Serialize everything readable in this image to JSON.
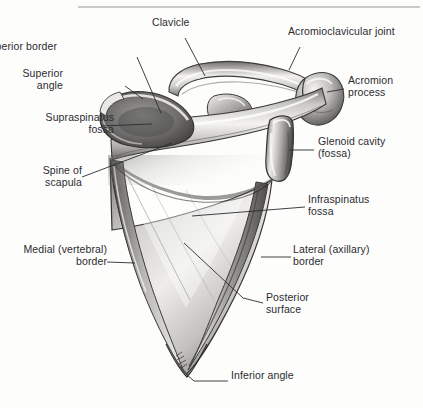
{
  "figure": {
    "type": "anatomical-illustration",
    "style": "grayscale pencil/airbrush medical illustration",
    "background_color": "#fdfdfc",
    "ink_color": "#2b2b2f",
    "bone_light": "#f3f2f0",
    "bone_mid": "#b8b7b4",
    "bone_dark": "#6e6d6b",
    "bone_shadow": "#3f3e3d",
    "divider_color": "#b9b9bb",
    "artist_signature": "mark"
  },
  "divider": {
    "name": "top-rule",
    "x1": 78,
    "y1": 7,
    "x2": 420,
    "y2": 7
  },
  "labels": [
    {
      "id": "clavicle",
      "text": "Clavicle",
      "align": "left",
      "x": 152,
      "y": 24,
      "leader": [
        [
          185,
          38
        ],
        [
          205,
          76
        ]
      ]
    },
    {
      "id": "acromioclavicular-joint",
      "text": "Acromioclavicular joint",
      "align": "left",
      "x": 288,
      "y": 33,
      "leader": [
        [
          300,
          47
        ],
        [
          300,
          47
        ],
        [
          289,
          70
        ]
      ]
    },
    {
      "id": "superior-border",
      "text": "Superior border",
      "align": "right",
      "x": 57,
      "y": 48,
      "leader": [
        [
          137,
          57
        ],
        [
          161,
          113
        ]
      ]
    },
    {
      "id": "acromion-process",
      "text": "Acromion\nprocess",
      "align": "left",
      "x": 348,
      "y": 82,
      "leader": [
        [
          344,
          89
        ],
        [
          327,
          92
        ]
      ]
    },
    {
      "id": "superior-angle",
      "text": "Superior\nangle",
      "align": "right",
      "x": 63,
      "y": 75,
      "leader": [
        [
          125,
          86
        ],
        [
          143,
          99
        ]
      ]
    },
    {
      "id": "supraspinatus-fossa",
      "text": "Supraspinatus\nfossa",
      "align": "right",
      "x": 14,
      "y": 119,
      "leader": [
        [
          101,
          126
        ],
        [
          152,
          124
        ]
      ]
    },
    {
      "id": "glenoid-cavity",
      "text": "Glenoid cavity\n(fossa)",
      "align": "left",
      "x": 318,
      "y": 143,
      "leader": [
        [
          314,
          150
        ],
        [
          289,
          150
        ]
      ]
    },
    {
      "id": "spine-of-scapula",
      "text": "Spine of\nscapula",
      "align": "right",
      "x": 28,
      "y": 172,
      "leader": [
        [
          82,
          177
        ],
        [
          172,
          143
        ]
      ]
    },
    {
      "id": "infraspinatus-fossa",
      "text": "Infraspinatus\nfossa",
      "align": "left",
      "x": 308,
      "y": 201,
      "leader": [
        [
          305,
          207
        ],
        [
          192,
          216
        ]
      ]
    },
    {
      "id": "medial-vertebral-border",
      "text": "Medial (vertebral)\nborder",
      "align": "right",
      "x": 18,
      "y": 251,
      "leader": [
        [
          107,
          262
        ],
        [
          135,
          263
        ]
      ]
    },
    {
      "id": "lateral-axillary-border",
      "text": "Lateral (axillary)\nborder",
      "align": "left",
      "x": 293,
      "y": 251,
      "leader": [
        [
          291,
          257
        ],
        [
          261,
          257
        ]
      ]
    },
    {
      "id": "posterior-surface",
      "text": "Posterior\nsurface",
      "align": "left",
      "x": 266,
      "y": 299,
      "leader": [
        [
          263,
          303
        ],
        [
          243,
          298
        ],
        [
          184,
          243
        ]
      ]
    },
    {
      "id": "inferior-angle",
      "text": "Inferior angle",
      "align": "left",
      "x": 231,
      "y": 376,
      "leader": [
        [
          228,
          381
        ],
        [
          194,
          381
        ],
        [
          186,
          374
        ]
      ]
    }
  ]
}
